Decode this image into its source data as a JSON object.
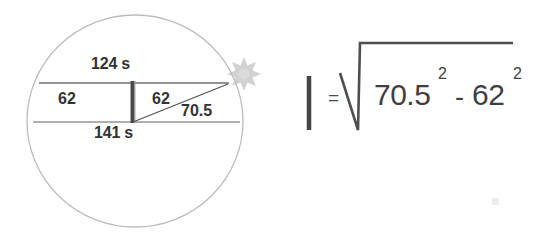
{
  "figure": {
    "name": "circle-chord-diagram",
    "circle": {
      "stroke": "#b9b9b9",
      "cx": 135,
      "cy": 121,
      "rx": 108,
      "ry": 106
    },
    "chords": {
      "top": {
        "label": "124 s",
        "y": 83,
        "x1": 39,
        "x2": 229,
        "stroke": "#6d6d6d"
      },
      "bottom": {
        "label": "141 s",
        "y": 122,
        "x1": 33,
        "x2": 240,
        "stroke": "#8d8d8d"
      }
    },
    "separator_bar": {
      "name": "vertical-offset-bar",
      "x": 132,
      "y1": 81,
      "y2": 123,
      "stroke": "#4a4a4a",
      "width": 4
    },
    "hypotenuse": {
      "label": "70.5",
      "x1": 133,
      "y1": 122,
      "x2": 228,
      "y2": 84,
      "stroke": "#555555"
    },
    "half_left_label": "62",
    "half_right_label": "62",
    "star": {
      "name": "starburst-marker",
      "cx": 244,
      "cy": 70,
      "radius_outer": 13,
      "radius_inner": 7,
      "points": 6,
      "fill": "#c9c9c9"
    }
  },
  "equation": {
    "name": "pythagorean-offset-equation",
    "result_symbol": "|",
    "equals": "=",
    "operand_a": "70.5",
    "exponent_a": "2",
    "operator": "-",
    "operand_b": "62",
    "exponent_b": "2",
    "radical_stroke": "#4f4f4f",
    "bar_stroke": "#3f3f3f"
  },
  "colors": {
    "background": "#ffffff",
    "ink": "#3b3b3b",
    "light_ink": "#b9b9b9",
    "accent_gray": "#c9c9c9"
  }
}
